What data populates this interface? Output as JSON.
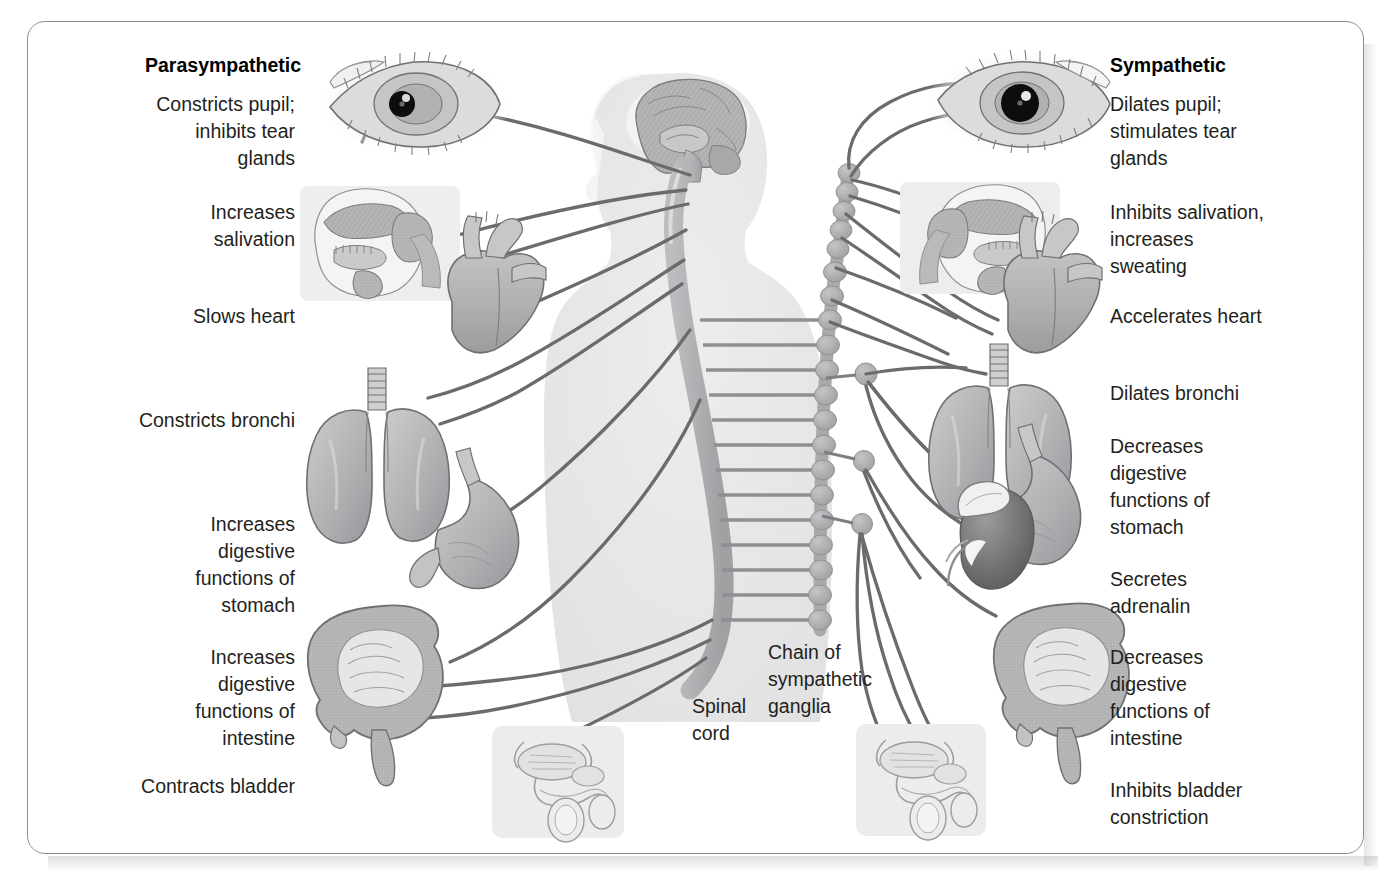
{
  "figure": {
    "type": "anatomical-diagram"
  },
  "colors": {
    "text": "#231f20",
    "nerve": "#6b6b6e",
    "organ_fill": "#b0b1b3",
    "organ_stroke": "#6f7073",
    "body_silhouette": "#e8e8e9",
    "frame": "#8d8f92",
    "ganglion": "#a8a9ab"
  },
  "headings": {
    "left": "Parasympathetic",
    "right": "Sympathetic"
  },
  "left_labels": [
    {
      "text": "Constricts pupil;\ninhibits tear\nglands",
      "organ": "eye"
    },
    {
      "text": "Increases\nsalivation",
      "organ": "salivary-glands"
    },
    {
      "text": "Slows heart",
      "organ": "heart"
    },
    {
      "text": "Constricts bronchi",
      "organ": "lungs"
    },
    {
      "text": "Increases\ndigestive\nfunctions of\nstomach",
      "organ": "stomach"
    },
    {
      "text": "Increases\ndigestive\nfunctions of\nintestine",
      "organ": "intestine"
    },
    {
      "text": "Contracts bladder",
      "organ": "bladder"
    }
  ],
  "right_labels": [
    {
      "text": "Dilates pupil;\nstimulates tear\nglands",
      "organ": "eye"
    },
    {
      "text": "Inhibits salivation,\nincreases\nsweating",
      "organ": "salivary-glands"
    },
    {
      "text": "Accelerates heart",
      "organ": "heart"
    },
    {
      "text": "Dilates bronchi",
      "organ": "lungs"
    },
    {
      "text": "Decreases\ndigestive\nfunctions of\nstomach",
      "organ": "stomach"
    },
    {
      "text": "Secretes\nadrenalin",
      "organ": "adrenal-gland"
    },
    {
      "text": "Decreases\ndigestive\nfunctions of\nintestine",
      "organ": "intestine"
    },
    {
      "text": "Inhibits bladder\nconstriction",
      "organ": "bladder"
    }
  ],
  "center_labels": [
    {
      "text": "Spinal\ncord",
      "name": "spinal-cord-label"
    },
    {
      "text": "Chain of\nsympathetic\nganglia",
      "name": "sympathetic-ganglia-label"
    }
  ],
  "organs": {
    "eye_left": "eye-constricted-pupil",
    "eye_right": "eye-dilated-pupil",
    "head_left": "head-sagittal-salivary-glands",
    "head_right": "head-sagittal-salivary-glands",
    "heart_left": "heart",
    "heart_right": "heart",
    "lungs_left": "lungs",
    "lungs_right": "lungs",
    "stomach_left": "stomach",
    "stomach_right": "stomach",
    "intestine_left": "intestine",
    "intestine_right": "intestine",
    "adrenal": "kidney-with-adrenal-gland",
    "bladder_left": "bladder-genitourinary",
    "bladder_right": "bladder-genitourinary",
    "brain": "brain-sagittal",
    "spinal_cord": "spinal-cord",
    "ganglia_chain": "sympathetic-ganglia-chain",
    "body": "human-body-silhouette"
  }
}
